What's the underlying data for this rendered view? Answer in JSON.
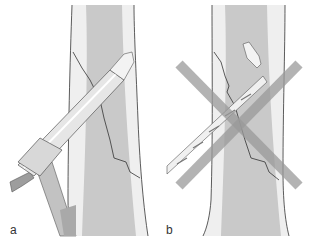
{
  "figure": {
    "panels": [
      {
        "id": "a",
        "label": "a",
        "description": "Drill bit guided through drill sleeve into bone"
      },
      {
        "id": "b",
        "label": "b",
        "description": "Free-hand drilling without sleeve — incorrect, broken drill tip"
      }
    ]
  },
  "colors": {
    "bone_cortex": "#eeeeee",
    "bone_medulla": "#c8c8c8",
    "outline": "#333333",
    "cross_mark": "#9a9a9a",
    "sleeve": "#e2e2e2",
    "handle": "#bdbdbd"
  }
}
